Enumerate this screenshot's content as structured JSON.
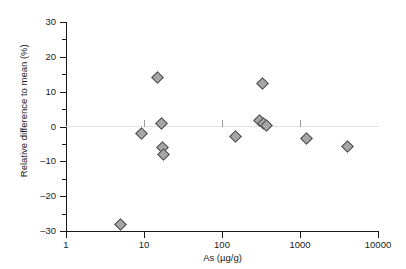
{
  "chart_data": {
    "type": "scatter",
    "title": "",
    "xlabel": "As (µg/g)",
    "ylabel": "Relative difference to mean (%)",
    "xscale": "log",
    "yscale": "linear",
    "xlim": [
      1,
      10000
    ],
    "ylim": [
      -30,
      30
    ],
    "grid": false,
    "legend": null,
    "x_ticks": [
      {
        "value": 1,
        "label": "1"
      },
      {
        "value": 10,
        "label": "10"
      },
      {
        "value": 100,
        "label": "100"
      },
      {
        "value": 1000,
        "label": "1000"
      },
      {
        "value": 10000,
        "label": "10000"
      }
    ],
    "y_ticks": [
      {
        "value": 30,
        "label": "30"
      },
      {
        "value": 20,
        "label": "20"
      },
      {
        "value": 10,
        "label": "10"
      },
      {
        "value": 0,
        "label": "0"
      },
      {
        "value": -10,
        "label": "–10"
      },
      {
        "value": -20,
        "label": "–20"
      },
      {
        "value": -30,
        "label": "–30"
      }
    ],
    "y_minor_ticks": [
      25,
      15,
      5,
      -5,
      -15,
      -25
    ],
    "reference_line": {
      "y": 0,
      "color": "#e2e2e2",
      "style": "solid"
    },
    "marker": {
      "shape": "diamond",
      "fill_color": "#a6a6a6",
      "edge_color": "#4a4a4a",
      "size_px": 9
    },
    "series": [
      {
        "name": "samples",
        "points": [
          {
            "x": 5.0,
            "y": -28.2
          },
          {
            "x": 9.3,
            "y": -2.0
          },
          {
            "x": 15.0,
            "y": 14.2
          },
          {
            "x": 16.5,
            "y": 0.8
          },
          {
            "x": 17.0,
            "y": -6.1
          },
          {
            "x": 17.5,
            "y": -8.0
          },
          {
            "x": 150.0,
            "y": -2.9
          },
          {
            "x": 300.0,
            "y": 1.7
          },
          {
            "x": 340.0,
            "y": 1.0
          },
          {
            "x": 370.0,
            "y": 0.4
          },
          {
            "x": 330.0,
            "y": 12.4
          },
          {
            "x": 1200.0,
            "y": -3.4
          },
          {
            "x": 4000.0,
            "y": -5.8
          }
        ]
      }
    ]
  }
}
